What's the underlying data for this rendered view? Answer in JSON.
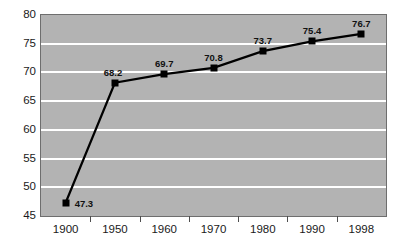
{
  "chart_data": {
    "type": "line",
    "title": "",
    "subtitle": "",
    "xlabel": "",
    "ylabel": "",
    "categories": [
      "1900",
      "1950",
      "1960",
      "1970",
      "1980",
      "1990",
      "1998"
    ],
    "values": [
      47.3,
      68.2,
      69.7,
      70.8,
      73.7,
      75.4,
      76.7
    ],
    "point_labels": [
      "47.3",
      "68.2",
      "69.7",
      "70.8",
      "73.7",
      "75.4",
      "76.7"
    ],
    "ylim": [
      45,
      80
    ],
    "y_ticks": [
      45,
      50,
      55,
      60,
      65,
      70,
      75,
      80
    ],
    "y_tick_labels": [
      "45",
      "50",
      "55",
      "60",
      "65",
      "70",
      "75",
      "80"
    ],
    "gridlines": [
      50,
      55,
      60,
      65,
      70,
      75
    ],
    "grid": true,
    "legend": false,
    "legend_position": "none",
    "series": [
      {
        "name": "",
        "values": [
          47.3,
          68.2,
          69.7,
          70.8,
          73.7,
          75.4,
          76.7
        ]
      }
    ],
    "colors": {
      "plot_background": "#b3b3b3",
      "gridline": "#ffffff",
      "line": "#000000",
      "marker": "#000000",
      "axis_text": "#1a1a1a",
      "border": "#6e6e6e",
      "page_background": "#ffffff"
    },
    "label_offsets": [
      {
        "dx": 9,
        "dy": -4,
        "align": "left"
      },
      {
        "dx": -2,
        "dy": -15,
        "align": "center"
      },
      {
        "dx": 0,
        "dy": -15,
        "align": "center"
      },
      {
        "dx": 0,
        "dy": -15,
        "align": "center"
      },
      {
        "dx": 0,
        "dy": -15,
        "align": "center"
      },
      {
        "dx": 0,
        "dy": -15,
        "align": "center"
      },
      {
        "dx": 0,
        "dy": -15,
        "align": "center"
      }
    ]
  }
}
